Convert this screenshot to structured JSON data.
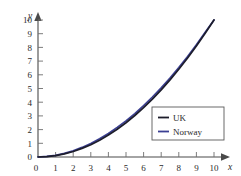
{
  "chart_data": {
    "type": "line",
    "title": "",
    "subtitle": "",
    "xlabel": "x",
    "ylabel": "y",
    "xlim": [
      0,
      10.6
    ],
    "ylim": [
      0,
      10.6
    ],
    "xticks": [
      "0",
      "1",
      "2",
      "3",
      "4",
      "5",
      "6",
      "7",
      "8",
      "9",
      "10"
    ],
    "yticks": [
      "0",
      "1",
      "2",
      "3",
      "4",
      "5",
      "6",
      "7",
      "8",
      "9",
      "10"
    ],
    "xtick_values": [
      0,
      1,
      2,
      3,
      4,
      5,
      6,
      7,
      8,
      9,
      10
    ],
    "ytick_values": [
      0,
      1,
      2,
      3,
      4,
      5,
      6,
      7,
      8,
      9,
      10
    ],
    "grid": false,
    "legend_position": "lower-right",
    "x": [
      0,
      0.5,
      1,
      1.5,
      2,
      2.5,
      3,
      3.5,
      4,
      4.5,
      5,
      5.5,
      6,
      6.5,
      7,
      7.5,
      8,
      8.5,
      9,
      9.5,
      10
    ],
    "series": [
      {
        "name": "UK",
        "color": "#1d1d2b",
        "values": [
          0,
          0.03,
          0.1,
          0.23,
          0.4,
          0.63,
          0.9,
          1.23,
          1.6,
          2.03,
          2.5,
          3.03,
          3.6,
          4.23,
          4.9,
          5.63,
          6.4,
          7.23,
          8.1,
          9.03,
          10
        ]
      },
      {
        "name": "Norway",
        "color": "#3b3f93",
        "values": [
          0,
          0.04,
          0.12,
          0.26,
          0.45,
          0.7,
          0.99,
          1.33,
          1.72,
          2.16,
          2.64,
          3.17,
          3.75,
          4.38,
          5.05,
          5.77,
          6.53,
          7.34,
          8.2,
          9.1,
          10
        ]
      }
    ]
  },
  "axes": {
    "x_axis_name": "x",
    "y_axis_name": "y"
  },
  "legend": {
    "entries": [
      {
        "label": "UK",
        "color": "#1d1d2b"
      },
      {
        "label": "Norway",
        "color": "#3b3f93"
      }
    ]
  },
  "colors": {
    "background": "#ffffff",
    "axis": "#4a4a4a",
    "tick_text": "#2b2b2b",
    "uk_line": "#1d1d2b",
    "norway_line": "#3b3f93",
    "legend_border": "#5a5a5a"
  }
}
